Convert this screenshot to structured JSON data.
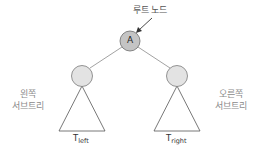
{
  "diagram": {
    "type": "binary-tree",
    "root_label": "루트 노드",
    "root_node": {
      "label": "A",
      "fill": "#c4c4c4"
    },
    "child_fill": "#e3e3e3",
    "stroke": "#6a6a6a",
    "left_subtree": {
      "caption_line1": "왼쪽",
      "caption_line2": "서브트리",
      "name_main": "T",
      "name_sub": "left"
    },
    "right_subtree": {
      "caption_line1": "오른쪽",
      "caption_line2": "서브트리",
      "name_main": "T",
      "name_sub": "right"
    }
  }
}
